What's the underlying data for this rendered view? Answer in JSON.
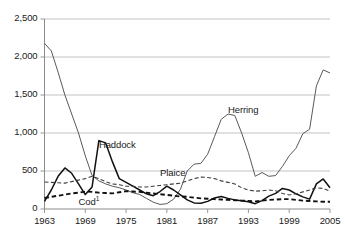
{
  "chart_data": {
    "type": "line",
    "title": "",
    "subtitle": "",
    "xlabel": "",
    "ylabel": "",
    "xlim": [
      1963,
      2005
    ],
    "ylim": [
      0,
      2500
    ],
    "grid": "horizontal",
    "legend_position": "inline-annotations",
    "x_ticks": [
      "1963",
      "1969",
      "1975",
      "1981",
      "1987",
      "1993",
      "1999",
      "2005"
    ],
    "x_tick_values": [
      1963,
      1969,
      1975,
      1981,
      1987,
      1993,
      1999,
      2005
    ],
    "y_ticks": [
      "0",
      "500",
      "1,000",
      "1,500",
      "2,000",
      "2,500"
    ],
    "y_tick_values": [
      0,
      500,
      1000,
      1500,
      2000,
      2500
    ],
    "x": [
      1963,
      1964,
      1965,
      1966,
      1967,
      1968,
      1969,
      1970,
      1971,
      1972,
      1973,
      1974,
      1975,
      1976,
      1977,
      1978,
      1979,
      1980,
      1981,
      1982,
      1983,
      1984,
      1985,
      1986,
      1987,
      1988,
      1989,
      1990,
      1991,
      1992,
      1993,
      1994,
      1995,
      1996,
      1997,
      1998,
      1999,
      2000,
      2001,
      2002,
      2003,
      2004,
      2005
    ],
    "series": [
      {
        "name": "Herring",
        "label": "Herring",
        "style": "solid-thin",
        "color": "#595959",
        "values": [
          2180,
          2080,
          1800,
          1500,
          1250,
          1000,
          700,
          440,
          370,
          330,
          300,
          280,
          250,
          215,
          190,
          140,
          90,
          60,
          70,
          130,
          260,
          500,
          590,
          600,
          720,
          950,
          1180,
          1250,
          1230,
          1000,
          740,
          430,
          480,
          430,
          440,
          560,
          700,
          800,
          990,
          1050,
          1620,
          1830,
          1790
        ]
      },
      {
        "name": "Haddock",
        "label": "Haddock",
        "style": "solid-thick",
        "color": "#111111",
        "values": [
          100,
          250,
          430,
          540,
          470,
          330,
          190,
          290,
          900,
          870,
          620,
          400,
          350,
          300,
          250,
          200,
          175,
          230,
          300,
          250,
          185,
          120,
          80,
          75,
          100,
          145,
          165,
          140,
          120,
          110,
          95,
          70,
          110,
          170,
          205,
          270,
          250,
          200,
          160,
          130,
          330,
          395,
          280
        ]
      },
      {
        "name": "Plaice",
        "label": "Plaice",
        "style": "dashed-thin",
        "color": "#3d3d3d",
        "values": [
          355,
          350,
          345,
          340,
          360,
          380,
          400,
          430,
          400,
          360,
          330,
          320,
          300,
          300,
          290,
          290,
          300,
          310,
          320,
          330,
          340,
          370,
          400,
          420,
          415,
          400,
          370,
          350,
          330,
          280,
          250,
          235,
          240,
          250,
          240,
          205,
          185,
          200,
          225,
          250,
          280,
          270,
          235
        ]
      },
      {
        "name": "Cod",
        "label": "Cod",
        "label_superscript": "1",
        "style": "dashed-thick",
        "color": "#111111",
        "values": [
          145,
          160,
          175,
          190,
          205,
          215,
          230,
          225,
          215,
          210,
          205,
          220,
          235,
          230,
          225,
          215,
          205,
          195,
          185,
          175,
          165,
          160,
          150,
          140,
          135,
          130,
          125,
          120,
          115,
          110,
          105,
          100,
          110,
          120,
          125,
          130,
          130,
          120,
          110,
          105,
          100,
          95,
          95
        ]
      }
    ],
    "annotations": [
      {
        "text": "Herring",
        "x": 1990,
        "y": 1290
      },
      {
        "text": "Haddock",
        "x": 1971,
        "y": 830
      },
      {
        "text": "Plaice",
        "x": 1980,
        "y": 455
      },
      {
        "text": "Cod",
        "x": 1968,
        "y": 75
      }
    ]
  }
}
